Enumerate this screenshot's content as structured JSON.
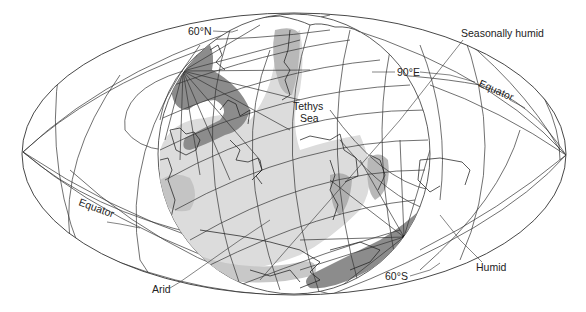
{
  "figure": {
    "type": "paleogeographic climate map",
    "projection": "equal-area ellipse with polar-oriented hemisphere overlay"
  },
  "labels": {
    "lat_60n": "60°N",
    "lon_90e": "90°E",
    "lat_60s": "60°S",
    "equator_left": "Equator",
    "equator_right": "Equator",
    "tethys_line1": "Tethys",
    "tethys_line2": "Sea",
    "seasonally_humid": "Seasonally humid",
    "humid": "Humid",
    "arid": "Arid"
  },
  "legend_zones": [
    {
      "name": "Humid",
      "color": "#8c8c8c"
    },
    {
      "name": "Seasonally humid",
      "color": "#b8b8b8"
    },
    {
      "name": "Arid",
      "color": "#dcdcdc"
    }
  ],
  "colors": {
    "background": "#ffffff",
    "linework": "#333333",
    "humid": "#8c8c8c",
    "seasonally_humid": "#b8b8b8",
    "arid": "#dcdcdc"
  }
}
